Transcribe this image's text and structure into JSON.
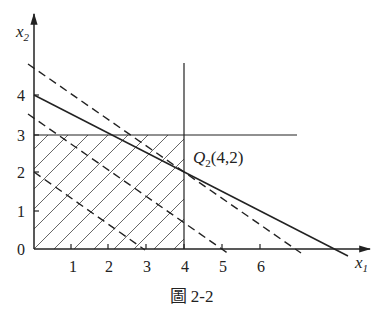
{
  "figure": {
    "caption": "圖 2-2",
    "axes": {
      "x_label": "x",
      "x_label_sub": "1",
      "y_label": "x",
      "y_label_sub": "2",
      "origin_label": "0",
      "x_ticks": [
        "1",
        "2",
        "3",
        "4",
        "5",
        "6"
      ],
      "y_ticks": [
        "1",
        "2",
        "3",
        "4"
      ]
    },
    "point": {
      "name": "Q",
      "sub": "2",
      "coords": "(4,2)"
    },
    "lines": [
      {
        "type": "solid",
        "description": "x1 + 2x2 = 8",
        "from": [
          0,
          4
        ],
        "to": [
          8,
          0
        ]
      },
      {
        "type": "solid",
        "description": "x1 = 4"
      },
      {
        "type": "solid",
        "description": "x2 = 3"
      },
      {
        "type": "dashed",
        "description": "objective contour through Q",
        "from": [
          -0.15,
          4.75
        ],
        "to": [
          7.1,
          -0.1
        ]
      },
      {
        "type": "dashed",
        "description": "objective contour",
        "from": [
          -0.15,
          3.5
        ],
        "to": [
          5.2,
          -0.15
        ]
      },
      {
        "type": "dashed",
        "description": "objective contour",
        "from": [
          0,
          2
        ],
        "to": [
          2.9,
          0
        ]
      }
    ],
    "feasible_region": "hatched rectangle 0<=x1<=4, 0<=x2<=3"
  }
}
